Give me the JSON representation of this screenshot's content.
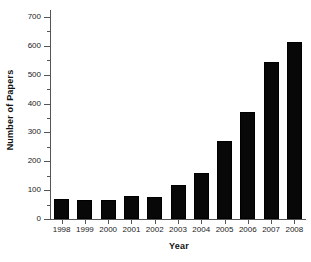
{
  "chart_data": {
    "type": "bar",
    "title": "",
    "xlabel": "Year",
    "ylabel": "Number of Papers",
    "categories": [
      "1998",
      "1999",
      "2000",
      "2001",
      "2002",
      "2003",
      "2004",
      "2005",
      "2006",
      "2007",
      "2008"
    ],
    "values": [
      70,
      65,
      67,
      80,
      76,
      118,
      160,
      270,
      371,
      544,
      615
    ],
    "ylim": [
      0,
      700
    ],
    "xlim_note": "categorical",
    "ytick_labels": [
      "0",
      "100",
      "200",
      "300",
      "400",
      "500",
      "600",
      "700"
    ],
    "ytick_values": [
      0,
      100,
      200,
      300,
      400,
      500,
      600,
      700
    ],
    "yminor_ticks": [
      50,
      150,
      250,
      350,
      450,
      550,
      650
    ],
    "grid": false,
    "legend": null,
    "legend_position": "none",
    "bar_color": "#080808",
    "axis_color": "#555555",
    "background_color": "#ffffff"
  },
  "axes": {
    "y_title": "Number of Papers",
    "x_title": "Year"
  }
}
